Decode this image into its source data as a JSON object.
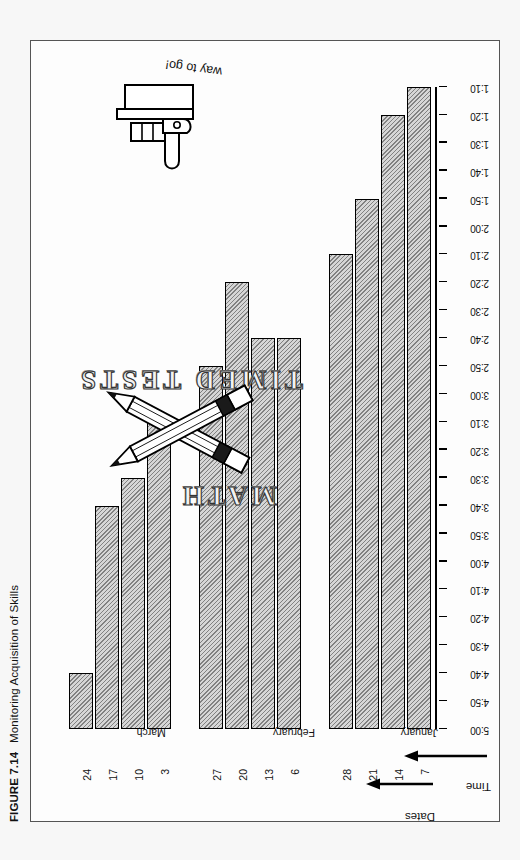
{
  "caption": {
    "figure_number": "FIGURE 7.14",
    "title": "Monitoring Acquisition of Skills"
  },
  "axes": {
    "time_axis_title": "Time",
    "dates_axis_title": "Dates",
    "time_ticks": [
      "5:00",
      "4:50",
      "4:40",
      "4:30",
      "4:20",
      "4:10",
      "4:00",
      "3:50",
      "3:40",
      "3:30",
      "3:20",
      "3:10",
      "3:00",
      "2:50",
      "2:40",
      "2:30",
      "2:20",
      "2:10",
      "2:00",
      "1:50",
      "1:40",
      "1:30",
      "1:20",
      "1:10"
    ]
  },
  "artwork": {
    "word_math": "MATH",
    "word_timed_tests": "TIMED TESTS",
    "encouragement": "way to go!",
    "pencils_icon": "crossed-pencils-icon",
    "thumbs_up_icon": "thumbs-up-icon"
  },
  "chart_data": {
    "type": "bar",
    "orientation": "horizontal",
    "title": "Monitoring Acquisition of Skills",
    "xlabel": "Time",
    "ylabel": "Dates",
    "grid": false,
    "legend": null,
    "xlim": [
      "1:10",
      "5:00"
    ],
    "xtick_labels": [
      "5:00",
      "4:50",
      "4:40",
      "4:30",
      "4:20",
      "4:10",
      "4:00",
      "3:50",
      "3:40",
      "3:30",
      "3:20",
      "3:10",
      "3:00",
      "2:50",
      "2:40",
      "2:30",
      "2:20",
      "2:10",
      "2:00",
      "1:50",
      "1:40",
      "1:30",
      "1:20",
      "1:10"
    ],
    "note": "Bar length = time taken to complete the timed math test; the axis runs from 5:00 (slowest, at the origin end) down to 1:10 (fastest).",
    "groups": [
      {
        "month": "January",
        "categories": [
          "7",
          "14",
          "21",
          "28"
        ],
        "values": [
          "5:00",
          "4:50",
          "4:20",
          "4:00"
        ]
      },
      {
        "month": "February",
        "categories": [
          "6",
          "13",
          "20",
          "27"
        ],
        "values": [
          "3:30",
          "3:30",
          "3:50",
          "3:20"
        ]
      },
      {
        "month": "March",
        "categories": [
          "3",
          "10",
          "17",
          "24"
        ],
        "values": [
          "3:00",
          "2:40",
          "2:30",
          "1:30"
        ]
      }
    ],
    "categories": [
      "7",
      "14",
      "21",
      "28",
      "6",
      "13",
      "20",
      "27",
      "3",
      "10",
      "17",
      "24"
    ],
    "values": [
      "5:00",
      "4:50",
      "4:20",
      "4:00",
      "3:30",
      "3:30",
      "3:50",
      "3:20",
      "3:00",
      "2:40",
      "2:30",
      "1:30"
    ],
    "values_minutes": [
      300,
      290,
      260,
      240,
      210,
      210,
      230,
      200,
      180,
      160,
      150,
      90
    ]
  }
}
